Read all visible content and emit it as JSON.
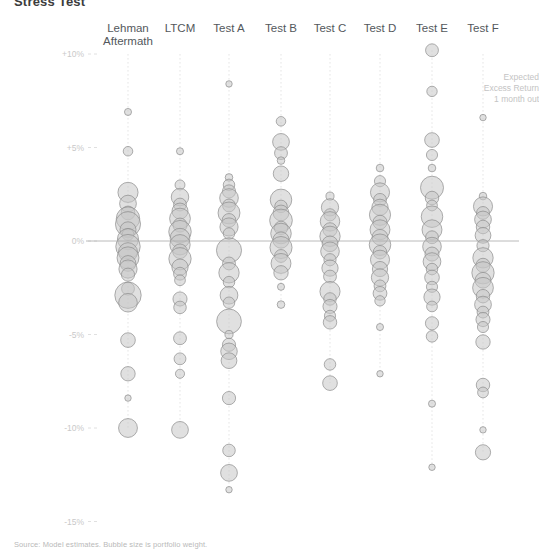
{
  "title": "Stress Test",
  "footnote": "Source: Model estimates. Bubble size is portfolio weight.",
  "axis_label_lines": [
    "Expected",
    "Excess Return",
    "1 month out"
  ],
  "chart_data": {
    "type": "scatter",
    "title": "Stress Test",
    "xlabel": "",
    "ylabel": "Expected Excess Return 1 month out",
    "ylim": [
      -16.5,
      11.5
    ],
    "yticks": [
      10,
      5,
      0,
      -5,
      -10,
      -15
    ],
    "ytick_labels": [
      "+10%",
      "+5%",
      "0%",
      "-5%",
      "-10%",
      "-15%"
    ],
    "grid": false,
    "legend": "none",
    "value_unit": "percent",
    "size_unit": "weight",
    "categories": [
      "Lehman Aftermath",
      "LTCM",
      "Test A",
      "Test B",
      "Test C",
      "Test D",
      "Test E",
      "Test F"
    ],
    "series": [
      {
        "name": "Lehman Aftermath",
        "points": [
          {
            "y": 6.9,
            "size": 0.6
          },
          {
            "y": 4.8,
            "size": 1.1
          },
          {
            "y": 2.6,
            "size": 4.9
          },
          {
            "y": 2.0,
            "size": 3.4
          },
          {
            "y": 1.5,
            "size": 2.3
          },
          {
            "y": 1.2,
            "size": 6.6
          },
          {
            "y": 0.9,
            "size": 7.6
          },
          {
            "y": 0.6,
            "size": 3.1
          },
          {
            "y": 0.35,
            "size": 1.7
          },
          {
            "y": 0.1,
            "size": 5.4
          },
          {
            "y": -0.3,
            "size": 7.2
          },
          {
            "y": -0.6,
            "size": 4.4
          },
          {
            "y": -0.9,
            "size": 5.8
          },
          {
            "y": -1.2,
            "size": 3.0
          },
          {
            "y": -1.5,
            "size": 4.0
          },
          {
            "y": -1.8,
            "size": 2.1
          },
          {
            "y": -2.55,
            "size": 2.0
          },
          {
            "y": -2.9,
            "size": 8.4
          },
          {
            "y": -3.3,
            "size": 4.2
          },
          {
            "y": -5.3,
            "size": 2.6
          },
          {
            "y": -7.1,
            "size": 2.5
          },
          {
            "y": -8.4,
            "size": 0.5
          },
          {
            "y": -10.0,
            "size": 4.3
          }
        ]
      },
      {
        "name": "LTCM",
        "points": [
          {
            "y": 4.8,
            "size": 0.6
          },
          {
            "y": 3.0,
            "size": 1.2
          },
          {
            "y": 2.35,
            "size": 3.7
          },
          {
            "y": 1.95,
            "size": 2.0
          },
          {
            "y": 1.6,
            "size": 3.1
          },
          {
            "y": 1.2,
            "size": 5.2
          },
          {
            "y": 0.85,
            "size": 2.4
          },
          {
            "y": 0.5,
            "size": 6.1
          },
          {
            "y": 0.15,
            "size": 4.7
          },
          {
            "y": -0.2,
            "size": 5.0
          },
          {
            "y": -0.55,
            "size": 2.6
          },
          {
            "y": -0.95,
            "size": 6.0
          },
          {
            "y": -1.4,
            "size": 3.2
          },
          {
            "y": -1.75,
            "size": 2.0
          },
          {
            "y": -2.1,
            "size": 1.4
          },
          {
            "y": -3.1,
            "size": 2.4
          },
          {
            "y": -3.55,
            "size": 1.9
          },
          {
            "y": -5.2,
            "size": 2.0
          },
          {
            "y": -6.3,
            "size": 1.7
          },
          {
            "y": -7.1,
            "size": 1.0
          },
          {
            "y": -10.1,
            "size": 3.4
          }
        ]
      },
      {
        "name": "Test A",
        "points": [
          {
            "y": 8.4,
            "size": 0.5
          },
          {
            "y": 3.4,
            "size": 0.7
          },
          {
            "y": 3.0,
            "size": 1.6
          },
          {
            "y": 2.65,
            "size": 2.1
          },
          {
            "y": 2.3,
            "size": 4.2
          },
          {
            "y": 1.9,
            "size": 2.0
          },
          {
            "y": 1.5,
            "size": 5.8
          },
          {
            "y": 1.1,
            "size": 2.3
          },
          {
            "y": 0.75,
            "size": 4.0
          },
          {
            "y": 0.4,
            "size": 1.6
          },
          {
            "y": -0.5,
            "size": 7.6
          },
          {
            "y": -1.2,
            "size": 2.0
          },
          {
            "y": -1.7,
            "size": 5.0
          },
          {
            "y": -2.2,
            "size": 1.6
          },
          {
            "y": -2.9,
            "size": 3.8
          },
          {
            "y": -3.3,
            "size": 1.6
          },
          {
            "y": -4.3,
            "size": 7.4
          },
          {
            "y": -5.0,
            "size": 0.8
          },
          {
            "y": -5.55,
            "size": 2.1
          },
          {
            "y": -5.9,
            "size": 3.3
          },
          {
            "y": -6.4,
            "size": 3.0
          },
          {
            "y": -8.4,
            "size": 2.1
          },
          {
            "y": -11.2,
            "size": 1.9
          },
          {
            "y": -12.4,
            "size": 3.4
          },
          {
            "y": -13.3,
            "size": 0.5
          }
        ]
      },
      {
        "name": "Test B",
        "points": [
          {
            "y": 6.4,
            "size": 1.1
          },
          {
            "y": 5.3,
            "size": 3.4
          },
          {
            "y": 4.7,
            "size": 2.0
          },
          {
            "y": 4.3,
            "size": 0.7
          },
          {
            "y": 3.6,
            "size": 2.9
          },
          {
            "y": 2.2,
            "size": 5.6
          },
          {
            "y": 1.85,
            "size": 1.9
          },
          {
            "y": 1.5,
            "size": 3.0
          },
          {
            "y": 1.1,
            "size": 6.2
          },
          {
            "y": 0.7,
            "size": 2.2
          },
          {
            "y": 0.4,
            "size": 5.1
          },
          {
            "y": 0.05,
            "size": 3.2
          },
          {
            "y": -0.35,
            "size": 5.9
          },
          {
            "y": -0.8,
            "size": 2.0
          },
          {
            "y": -1.2,
            "size": 4.8
          },
          {
            "y": -1.7,
            "size": 2.5
          },
          {
            "y": -2.45,
            "size": 0.6
          },
          {
            "y": -3.4,
            "size": 0.7
          }
        ]
      },
      {
        "name": "Test C",
        "points": [
          {
            "y": 2.4,
            "size": 0.8
          },
          {
            "y": 1.8,
            "size": 3.6
          },
          {
            "y": 1.4,
            "size": 1.8
          },
          {
            "y": 1.05,
            "size": 4.6
          },
          {
            "y": 0.6,
            "size": 2.4
          },
          {
            "y": 0.25,
            "size": 5.0
          },
          {
            "y": -0.15,
            "size": 3.0
          },
          {
            "y": -0.55,
            "size": 4.2
          },
          {
            "y": -1.0,
            "size": 1.8
          },
          {
            "y": -1.45,
            "size": 3.2
          },
          {
            "y": -1.9,
            "size": 2.0
          },
          {
            "y": -2.7,
            "size": 4.9
          },
          {
            "y": -3.1,
            "size": 1.9
          },
          {
            "y": -3.5,
            "size": 2.4
          },
          {
            "y": -4.0,
            "size": 1.5
          },
          {
            "y": -4.35,
            "size": 2.2
          },
          {
            "y": -6.6,
            "size": 1.6
          },
          {
            "y": -7.6,
            "size": 2.6
          }
        ]
      },
      {
        "name": "Test D",
        "points": [
          {
            "y": 3.9,
            "size": 0.7
          },
          {
            "y": 3.2,
            "size": 1.5
          },
          {
            "y": 2.6,
            "size": 4.4
          },
          {
            "y": 2.2,
            "size": 2.0
          },
          {
            "y": 1.8,
            "size": 3.2
          },
          {
            "y": 1.4,
            "size": 5.4
          },
          {
            "y": 1.0,
            "size": 2.4
          },
          {
            "y": 0.6,
            "size": 4.8
          },
          {
            "y": 0.2,
            "size": 3.0
          },
          {
            "y": -0.2,
            "size": 5.6
          },
          {
            "y": -0.6,
            "size": 2.2
          },
          {
            "y": -1.0,
            "size": 4.4
          },
          {
            "y": -1.5,
            "size": 2.8
          },
          {
            "y": -1.95,
            "size": 3.6
          },
          {
            "y": -2.4,
            "size": 1.7
          },
          {
            "y": -2.8,
            "size": 2.3
          },
          {
            "y": -3.2,
            "size": 1.3
          },
          {
            "y": -4.6,
            "size": 0.6
          },
          {
            "y": -7.1,
            "size": 0.5
          }
        ]
      },
      {
        "name": "Test E",
        "points": [
          {
            "y": 10.2,
            "size": 2.0
          },
          {
            "y": 8.0,
            "size": 1.3
          },
          {
            "y": 5.4,
            "size": 2.6
          },
          {
            "y": 4.6,
            "size": 1.5
          },
          {
            "y": 3.9,
            "size": 0.7
          },
          {
            "y": 2.85,
            "size": 6.4
          },
          {
            "y": 2.3,
            "size": 2.2
          },
          {
            "y": 1.9,
            "size": 1.4
          },
          {
            "y": 1.3,
            "size": 5.6
          },
          {
            "y": 0.6,
            "size": 4.8
          },
          {
            "y": 0.2,
            "size": 2.0
          },
          {
            "y": -0.3,
            "size": 4.2
          },
          {
            "y": -0.7,
            "size": 2.4
          },
          {
            "y": -1.1,
            "size": 3.8
          },
          {
            "y": -1.5,
            "size": 1.6
          },
          {
            "y": -1.95,
            "size": 2.6
          },
          {
            "y": -2.45,
            "size": 1.5
          },
          {
            "y": -3.0,
            "size": 3.2
          },
          {
            "y": -3.5,
            "size": 1.4
          },
          {
            "y": -4.4,
            "size": 2.1
          },
          {
            "y": -5.1,
            "size": 1.6
          },
          {
            "y": -8.7,
            "size": 0.6
          },
          {
            "y": -12.1,
            "size": 0.5
          }
        ]
      },
      {
        "name": "Test F",
        "points": [
          {
            "y": 6.6,
            "size": 0.5
          },
          {
            "y": 2.4,
            "size": 0.7
          },
          {
            "y": 1.85,
            "size": 4.4
          },
          {
            "y": 1.5,
            "size": 2.0
          },
          {
            "y": 1.15,
            "size": 3.4
          },
          {
            "y": 0.75,
            "size": 2.2
          },
          {
            "y": 0.3,
            "size": 3.0
          },
          {
            "y": -0.25,
            "size": 1.8
          },
          {
            "y": -0.9,
            "size": 5.0
          },
          {
            "y": -1.3,
            "size": 2.4
          },
          {
            "y": -1.7,
            "size": 6.0
          },
          {
            "y": -2.1,
            "size": 3.0
          },
          {
            "y": -2.5,
            "size": 5.2
          },
          {
            "y": -2.95,
            "size": 2.2
          },
          {
            "y": -3.4,
            "size": 3.4
          },
          {
            "y": -3.8,
            "size": 1.7
          },
          {
            "y": -4.2,
            "size": 2.4
          },
          {
            "y": -4.6,
            "size": 1.5
          },
          {
            "y": -5.4,
            "size": 2.5
          },
          {
            "y": -7.7,
            "size": 2.2
          },
          {
            "y": -8.1,
            "size": 1.4
          },
          {
            "y": -10.1,
            "size": 0.5
          },
          {
            "y": -11.3,
            "size": 2.8
          }
        ]
      }
    ],
    "column_x": [
      128,
      180,
      229,
      281,
      330,
      380,
      432,
      483
    ],
    "geometry": {
      "zero_y": 241,
      "px_per_percent": 18.7,
      "plot_left": 96,
      "plot_right": 519,
      "stem_top": 54
    }
  }
}
